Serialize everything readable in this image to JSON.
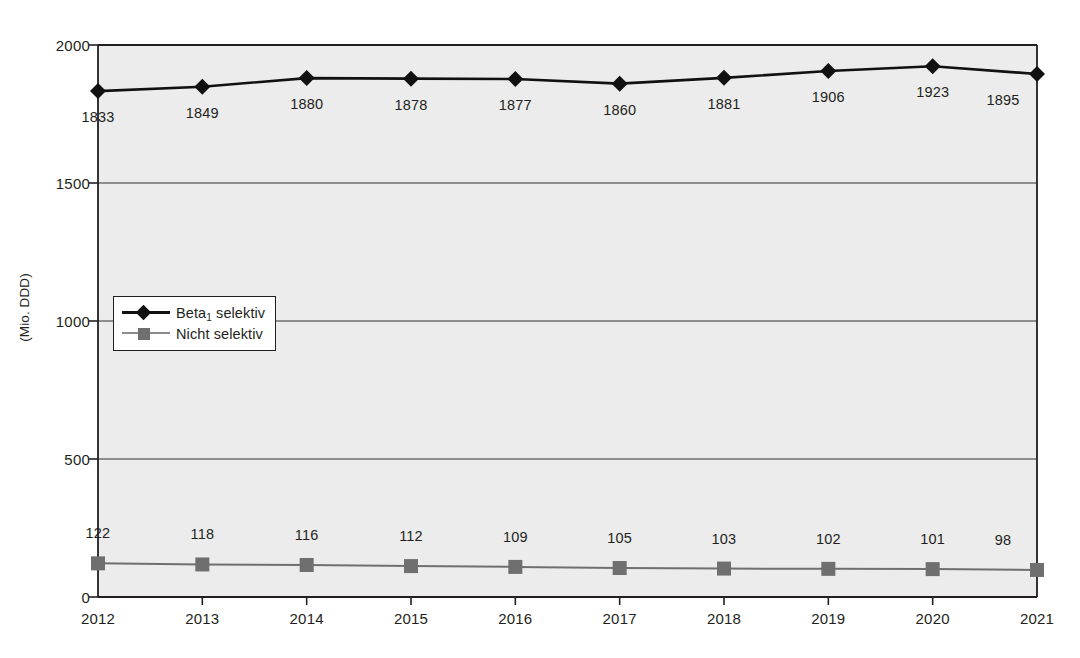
{
  "chart_data": {
    "type": "line",
    "title": "",
    "subtitle": "",
    "xlabel": "",
    "ylabel": "(Mio. DDD)",
    "categories": [
      "2012",
      "2013",
      "2014",
      "2015",
      "2016",
      "2017",
      "2018",
      "2019",
      "2020",
      "2021"
    ],
    "x": [
      2012,
      2013,
      2014,
      2015,
      2016,
      2017,
      2018,
      2019,
      2020,
      2021
    ],
    "series": [
      {
        "name": "Beta1 selektiv",
        "name_base": "Beta",
        "name_sub": "1",
        "name_rest": " selektiv",
        "marker": "diamond",
        "color": "#111111",
        "values": [
          1833,
          1849,
          1880,
          1878,
          1877,
          1860,
          1881,
          1906,
          1923,
          1895
        ],
        "labels": [
          "1833",
          "1849",
          "1880",
          "1878",
          "1877",
          "1860",
          "1881",
          "1906",
          "1923",
          "1895"
        ]
      },
      {
        "name": "Nicht selektiv",
        "marker": "square",
        "color": "#6f6f6f",
        "values": [
          122,
          118,
          116,
          112,
          109,
          105,
          103,
          102,
          101,
          98
        ],
        "labels": [
          "122",
          "118",
          "116",
          "112",
          "109",
          "105",
          "103",
          "102",
          "101",
          "98"
        ]
      }
    ],
    "ylim": [
      0,
      2000
    ],
    "yticks": [
      0,
      500,
      1000,
      1500,
      2000
    ],
    "ytick_labels": [
      "0",
      "500",
      "1000",
      "1500",
      "2000"
    ],
    "grid": true,
    "grid_axis": "y",
    "legend_position": "inside-left-middle",
    "plot_background": "#ececec",
    "axis_color": "#231f20",
    "grid_color": "#6e6e6e"
  }
}
